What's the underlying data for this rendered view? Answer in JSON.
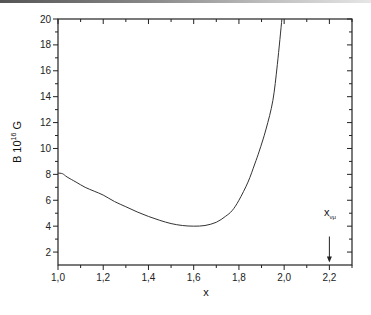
{
  "chart_data": {
    "type": "line",
    "title": "",
    "xlabel": "x",
    "ylabel": "B  10^16 G",
    "ylabel_parts": {
      "main": "B  10",
      "sup": "16",
      "unit": " G"
    },
    "xlim": [
      1.0,
      2.3
    ],
    "ylim": [
      1,
      20
    ],
    "grid": false,
    "legend": null,
    "x_ticks": [
      1.0,
      1.2,
      1.4,
      1.6,
      1.8,
      2.0,
      2.2
    ],
    "x_tick_labels": [
      "1,0",
      "1,2",
      "1,4",
      "1,6",
      "1,8",
      "2,0",
      "2,2"
    ],
    "y_ticks": [
      2,
      4,
      6,
      8,
      10,
      12,
      14,
      16,
      18,
      20
    ],
    "y_tick_labels": [
      "2",
      "4",
      "6",
      "8",
      "10",
      "12",
      "14",
      "16",
      "18",
      "20"
    ],
    "series": [
      {
        "name": "B(x)",
        "x": [
          1.0,
          1.02,
          1.04,
          1.08,
          1.12,
          1.16,
          1.2,
          1.25,
          1.3,
          1.35,
          1.4,
          1.45,
          1.5,
          1.55,
          1.6,
          1.65,
          1.7,
          1.74,
          1.77,
          1.8,
          1.84,
          1.87,
          1.89,
          1.92,
          1.95,
          1.97,
          1.99
        ],
        "y": [
          8.1,
          8.05,
          7.8,
          7.4,
          7.0,
          6.7,
          6.4,
          5.9,
          5.5,
          5.1,
          4.75,
          4.45,
          4.2,
          4.05,
          4.0,
          4.05,
          4.3,
          4.75,
          5.2,
          6.0,
          7.4,
          8.8,
          9.8,
          11.5,
          13.7,
          16.5,
          20.0
        ],
        "color": "#333333"
      }
    ],
    "annotations": [
      {
        "text": "x",
        "subscript": "νμ",
        "x": 2.2,
        "arrow_from_y": 3.2,
        "arrow_to_y": 1.2
      }
    ]
  },
  "labels": {
    "x_axis_title": "x",
    "annotation_main": "x",
    "annotation_sub": "νμ"
  }
}
